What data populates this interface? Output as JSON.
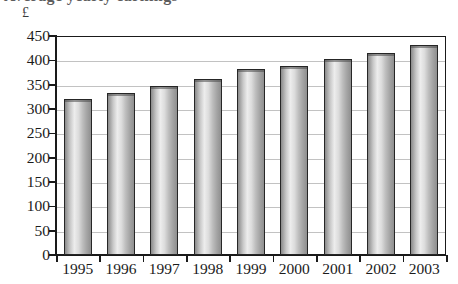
{
  "figure": {
    "cropped_title": "Average yearly earnings",
    "unit_label": "£"
  },
  "chart_data": {
    "type": "bar",
    "title": "",
    "xlabel": "",
    "ylabel": "£",
    "categories": [
      "1995",
      "1996",
      "1997",
      "1998",
      "1999",
      "2000",
      "2001",
      "2002",
      "2003"
    ],
    "values": [
      320,
      332,
      347,
      362,
      383,
      389,
      402,
      415,
      431
    ],
    "ylim": [
      0,
      450
    ],
    "ytick_step": 50,
    "yticks": [
      "0",
      "50",
      "100",
      "150",
      "200",
      "250",
      "300",
      "350",
      "400",
      "450"
    ],
    "grid": true,
    "legend": "none",
    "series": [
      {
        "name": "earnings",
        "values": [
          320,
          332,
          347,
          362,
          383,
          389,
          402,
          415,
          431
        ]
      }
    ],
    "colors": {
      "bar_light": "#ededed",
      "bar_mid": "#bdbdbd",
      "bar_dark": "#8a8a8a",
      "bar_outline": "#262626",
      "gridline": "#c2c2c2",
      "axis": "#1a1a1a",
      "text": "#1b1b1b",
      "background": "#ffffff"
    }
  }
}
